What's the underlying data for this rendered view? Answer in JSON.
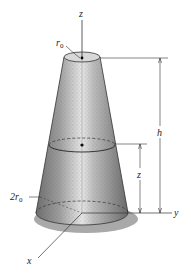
{
  "diagram": {
    "title": "",
    "labels": {
      "z_axis": "z",
      "y_axis": "y",
      "x_axis": "x",
      "top_radius": "r",
      "top_radius_sub": "0",
      "bottom_radius_coef": "2r",
      "bottom_radius_sub": "0",
      "height": "h",
      "slice_height": "z"
    },
    "colors": {
      "cone_body": "#a9a9a9",
      "cone_highlight": "#e8e8e8",
      "cone_shadow": "#6f6f6f",
      "base_shadow": "#9a9a9a",
      "lines": "#333333",
      "top_face": "#d8d8d8"
    }
  }
}
